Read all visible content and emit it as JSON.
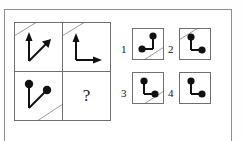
{
  "puzzle": {
    "type": "matrix-reasoning",
    "question_mark": "?",
    "ink_color": "#111111",
    "frame_color": "#8d8d8d",
    "cell_border_color": "#6f6f6f",
    "background": "#ffffff"
  },
  "matrix": {
    "rows": 2,
    "cols": 2,
    "cells": [
      {
        "position": "top-left",
        "description": "two arrows from common origin: one pointing up, one pointing up-right diagonally",
        "endpoint_style": "arrowhead",
        "diagonal_corner": "top-left"
      },
      {
        "position": "top-right",
        "description": "L shape: arrow pointing up and arrow pointing right from a corner",
        "endpoint_style": "arrowhead",
        "diagonal_corner": "top-left"
      },
      {
        "position": "bottom-left",
        "description": "two segments from common origin: one up, one up-right diagonally, ending in filled dots",
        "endpoint_style": "dot",
        "diagonal_corner": "bottom-right"
      },
      {
        "position": "bottom-right",
        "description": "missing cell, shows question mark",
        "endpoint_style": "none",
        "diagonal_corner": "none"
      }
    ]
  },
  "options": [
    {
      "number": "1",
      "description": "dot at top-right, vertical line down, horizontal line left to a dot at bottom-left",
      "endpoint_style": "dot",
      "diagonal_corner": "bottom-right"
    },
    {
      "number": "2",
      "description": "dot at top of vertical line, corner, horizontal line right to a dot",
      "endpoint_style": "dot",
      "diagonal_corner": "top-left"
    },
    {
      "number": "3",
      "description": "dot at top of vertical line, corner, horizontal line right to a dot",
      "endpoint_style": "dot",
      "diagonal_corner": "bottom-right"
    },
    {
      "number": "4",
      "description": "dot at top of vertical line, corner, horizontal line right to a dot, no diagonal",
      "endpoint_style": "dot",
      "diagonal_corner": "none"
    }
  ]
}
